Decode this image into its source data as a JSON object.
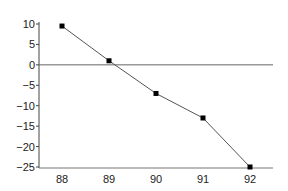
{
  "chart_data": {
    "type": "line",
    "title": "",
    "xlabel": "",
    "ylabel": "",
    "x": [
      88,
      89,
      90,
      91,
      92
    ],
    "categories": [
      "88",
      "89",
      "90",
      "91",
      "92"
    ],
    "series": [
      {
        "name": "",
        "values": [
          9.5,
          1,
          -7,
          -13,
          -25
        ],
        "marker": "square",
        "color": "#555555",
        "marker_color": "#000000"
      }
    ],
    "ylim": [
      -25,
      10
    ],
    "yticks": [
      10,
      5,
      0,
      -5,
      -10,
      -15,
      -20,
      -25
    ],
    "ytick_labels": [
      "10",
      "5",
      "0",
      "−5",
      "−10",
      "−15",
      "−20",
      "−25"
    ],
    "xtick_labels": [
      "88",
      "89",
      "90",
      "91",
      "92"
    ],
    "zero_line": true,
    "grid": false,
    "legend": null
  }
}
